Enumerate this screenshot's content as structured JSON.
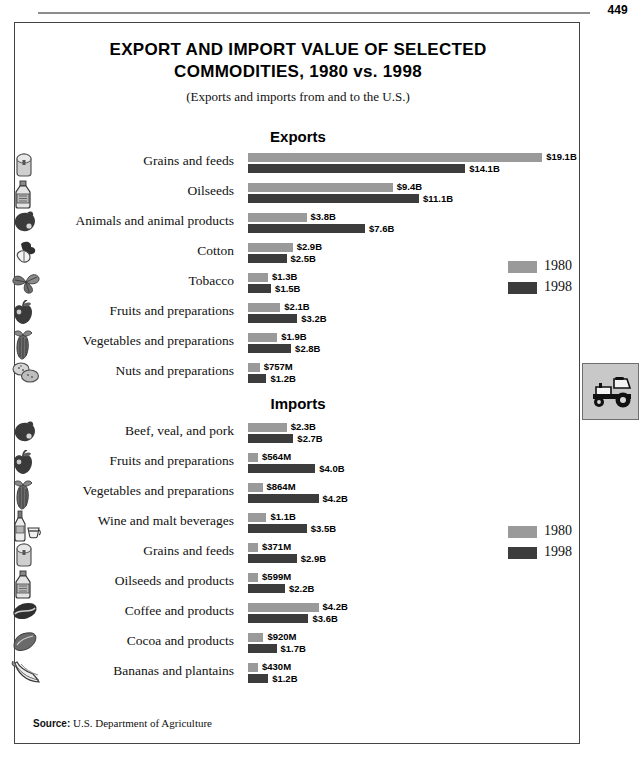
{
  "page": {
    "number": "449"
  },
  "figure": {
    "title_line1": "EXPORT AND IMPORT VALUE OF SELECTED",
    "title_line2": "COMMODITIES, 1980 vs. 1998",
    "subtitle": "(Exports and imports from and to the U.S.)",
    "source_label": "Source:",
    "source_text": "U.S. Department of Agriculture"
  },
  "side_tab": {
    "icon": "tractor-icon"
  },
  "legend": {
    "exports": [
      {
        "label": "1980",
        "color": "#9a9a9a"
      },
      {
        "label": "1998",
        "color": "#3c3c3c"
      }
    ],
    "imports": [
      {
        "label": "1980",
        "color": "#9a9a9a"
      },
      {
        "label": "1998",
        "color": "#3c3c3c"
      }
    ]
  },
  "chart_data": [
    {
      "type": "bar",
      "title": "Exports",
      "orientation": "horizontal",
      "xlabel": "",
      "ylabel": "",
      "unit": "USD",
      "grid": false,
      "legend_position": "right",
      "series": [
        {
          "name": "1980",
          "color": "#9a9a9a"
        },
        {
          "name": "1998",
          "color": "#3c3c3c"
        }
      ],
      "categories": [
        "Grains and feeds",
        "Oilseeds",
        "Animals and animal products",
        "Cotton",
        "Tobacco",
        "Fruits and preparations",
        "Vegetables and preparations",
        "Nuts and preparations"
      ],
      "icons": [
        "grain-silo-icon",
        "oil-bottle-icon",
        "animal-icon",
        "cotton-boll-icon",
        "tobacco-leaf-icon",
        "apple-icon",
        "corn-icon",
        "nuts-icon"
      ],
      "rows": [
        {
          "category": "Grains and feeds",
          "icon": "grain-silo-icon",
          "v1980": 19.1,
          "v1998": 14.1,
          "label1980": "$19.1B",
          "label1998": "$14.1B"
        },
        {
          "category": "Oilseeds",
          "icon": "oil-bottle-icon",
          "v1980": 9.4,
          "v1998": 11.1,
          "label1980": "$9.4B",
          "label1998": "$11.1B"
        },
        {
          "category": "Animals and animal products",
          "icon": "animal-icon",
          "v1980": 3.8,
          "v1998": 7.6,
          "label1980": "$3.8B",
          "label1998": "$7.6B"
        },
        {
          "category": "Cotton",
          "icon": "cotton-boll-icon",
          "v1980": 2.9,
          "v1998": 2.5,
          "label1980": "$2.9B",
          "label1998": "$2.5B"
        },
        {
          "category": "Tobacco",
          "icon": "tobacco-leaf-icon",
          "v1980": 1.3,
          "v1998": 1.5,
          "label1980": "$1.3B",
          "label1998": "$1.5B"
        },
        {
          "category": "Fruits and preparations",
          "icon": "apple-icon",
          "v1980": 2.1,
          "v1998": 3.2,
          "label1980": "$2.1B",
          "label1998": "$3.2B"
        },
        {
          "category": "Vegetables and preparations",
          "icon": "corn-icon",
          "v1980": 1.9,
          "v1998": 2.8,
          "label1980": "$1.9B",
          "label1998": "$2.8B"
        },
        {
          "category": "Nuts and preparations",
          "icon": "nuts-icon",
          "v1980": 0.757,
          "v1998": 1.2,
          "label1980": "$757M",
          "label1998": "$1.2B"
        }
      ],
      "px_per_billion": 15.4
    },
    {
      "type": "bar",
      "title": "Imports",
      "orientation": "horizontal",
      "xlabel": "",
      "ylabel": "",
      "unit": "USD",
      "grid": false,
      "legend_position": "right",
      "series": [
        {
          "name": "1980",
          "color": "#9a9a9a"
        },
        {
          "name": "1998",
          "color": "#3c3c3c"
        }
      ],
      "categories": [
        "Beef, veal, and pork",
        "Fruits and preparations",
        "Vegetables and preparations",
        "Wine and malt beverages",
        "Grains and feeds",
        "Oilseeds and products",
        "Coffee and products",
        "Cocoa and products",
        "Bananas and plantains"
      ],
      "icons": [
        "animal-icon",
        "apple-icon",
        "corn-icon",
        "wine-bottle-icon",
        "grain-silo-icon",
        "oil-bottle-icon",
        "coffee-bean-icon",
        "cocoa-bean-icon",
        "banana-icon"
      ],
      "rows": [
        {
          "category": "Beef, veal, and pork",
          "icon": "animal-icon",
          "v1980": 2.3,
          "v1998": 2.7,
          "label1980": "$2.3B",
          "label1998": "$2.7B"
        },
        {
          "category": "Fruits and preparations",
          "icon": "apple-icon",
          "v1980": 0.564,
          "v1998": 4.0,
          "label1980": "$564M",
          "label1998": "$4.0B"
        },
        {
          "category": "Vegetables and preparations",
          "icon": "corn-icon",
          "v1980": 0.864,
          "v1998": 4.2,
          "label1980": "$864M",
          "label1998": "$4.2B"
        },
        {
          "category": "Wine and malt beverages",
          "icon": "wine-bottle-icon",
          "v1980": 1.1,
          "v1998": 3.5,
          "label1980": "$1.1B",
          "label1998": "$3.5B"
        },
        {
          "category": "Grains and feeds",
          "icon": "grain-silo-icon",
          "v1980": 0.371,
          "v1998": 2.9,
          "label1980": "$371M",
          "label1998": "$2.9B"
        },
        {
          "category": "Oilseeds and products",
          "icon": "oil-bottle-icon",
          "v1980": 0.599,
          "v1998": 2.2,
          "label1980": "$599M",
          "label1998": "$2.2B"
        },
        {
          "category": "Coffee and products",
          "icon": "coffee-bean-icon",
          "v1980": 4.2,
          "v1998": 3.6,
          "label1980": "$4.2B",
          "label1998": "$3.6B"
        },
        {
          "category": "Cocoa and products",
          "icon": "cocoa-bean-icon",
          "v1980": 0.92,
          "v1998": 1.7,
          "label1980": "$920M",
          "label1998": "$1.7B"
        },
        {
          "category": "Bananas and plantains",
          "icon": "banana-icon",
          "v1980": 0.43,
          "v1998": 1.2,
          "label1980": "$430M",
          "label1998": "$1.2B"
        }
      ],
      "px_per_billion": 16.8
    }
  ]
}
